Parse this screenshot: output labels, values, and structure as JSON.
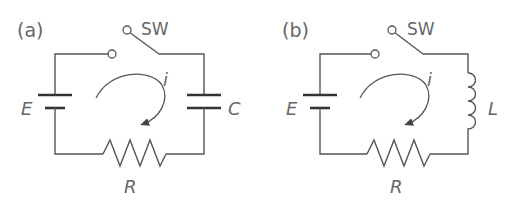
{
  "panels": [
    {
      "id": "a",
      "label": "(a)",
      "switch_label": "SW",
      "source_label": "E",
      "current_label": "i",
      "load_label": "C",
      "load_type": "capacitor",
      "resistor_label": "R"
    },
    {
      "id": "b",
      "label": "(b)",
      "switch_label": "SW",
      "source_label": "E",
      "current_label": "i",
      "load_label": "L",
      "load_type": "inductor",
      "resistor_label": "R"
    }
  ],
  "colors": {
    "line": "#555555",
    "text": "#666666",
    "background": "#ffffff"
  }
}
